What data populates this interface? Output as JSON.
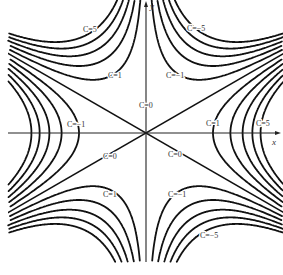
{
  "diagram": {
    "title": "",
    "origin_px": [
      146,
      133
    ],
    "unit_px": 67,
    "axes": {
      "x_label": "x",
      "y_label": "y",
      "color": "#222222"
    },
    "curve_color": "#111111",
    "c_values_positive": [
      1,
      2,
      3,
      4,
      5
    ],
    "c_values_negative": [
      -1,
      -2,
      -3,
      -4,
      -5
    ],
    "labels": [
      {
        "id": "c5-top-left",
        "text": "C=5",
        "x": 83,
        "y": 32
      },
      {
        "id": "c1-top-left",
        "text": "C=1",
        "x": 108,
        "y": 78
      },
      {
        "id": "cm5-top-right",
        "text": "C=−5",
        "x": 187,
        "y": 31
      },
      {
        "id": "cm1-top-right",
        "text": "C=−1",
        "x": 166,
        "y": 78
      },
      {
        "id": "c0-vertical",
        "text": "C=0",
        "x": 139,
        "y": 108
      },
      {
        "id": "cm1-left",
        "text": "C=−1",
        "x": 67,
        "y": 127
      },
      {
        "id": "c1-right",
        "text": "C=1",
        "x": 206,
        "y": 126
      },
      {
        "id": "c5-right",
        "text": "C=5",
        "x": 256,
        "y": 126
      },
      {
        "id": "c0-lower-left",
        "text": "C=0",
        "x": 103,
        "y": 159
      },
      {
        "id": "c0-lower-right",
        "text": "C=0",
        "x": 168,
        "y": 157
      },
      {
        "id": "c1-bottom-left",
        "text": "C=1",
        "x": 103,
        "y": 197
      },
      {
        "id": "cm1-bottom-right",
        "text": "C=−1",
        "x": 168,
        "y": 197
      },
      {
        "id": "cm5-bottom-right",
        "text": "C=−5",
        "x": 200,
        "y": 238
      }
    ]
  }
}
